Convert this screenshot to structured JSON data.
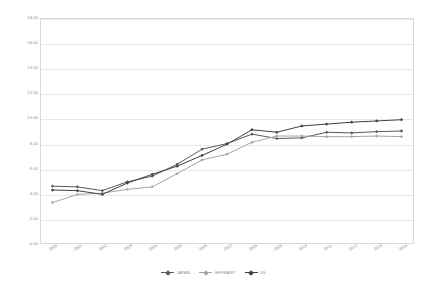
{
  "chart_data": {
    "type": "line",
    "title": "",
    "xlabel": "",
    "ylabel": "",
    "x": [
      "2000",
      "2001",
      "2002",
      "2003",
      "2004",
      "2005",
      "2006",
      "2007",
      "2008",
      "2009",
      "2010",
      "2011",
      "2012",
      "2013",
      "2014"
    ],
    "ylim": [
      0,
      18
    ],
    "ytick_values": [
      "0.00",
      "2.00",
      "4.00",
      "6.00",
      "8.00",
      "10.00",
      "12.00",
      "14.00",
      "16.00",
      "18.00"
    ],
    "grid": true,
    "legend_position": "bottom",
    "series": [
      {
        "name": "JAPAN",
        "color": "#595959",
        "values": [
          4.6,
          4.55,
          4.25,
          4.95,
          5.4,
          6.35,
          7.55,
          8.0,
          8.75,
          8.4,
          8.45,
          8.9,
          8.85,
          8.95,
          9.0
        ]
      },
      {
        "name": "GERMANY",
        "color": "#a6a6a6",
        "values": [
          3.3,
          3.95,
          4.05,
          4.35,
          4.55,
          5.6,
          6.7,
          7.15,
          8.1,
          8.6,
          8.6,
          8.55,
          8.55,
          8.6,
          8.55
        ]
      },
      {
        "name": "US",
        "color": "#404040",
        "values": [
          4.3,
          4.25,
          3.95,
          4.85,
          5.55,
          6.2,
          7.05,
          7.95,
          9.1,
          8.9,
          9.4,
          9.55,
          9.7,
          9.8,
          9.9
        ]
      }
    ]
  },
  "legend": {
    "items": [
      {
        "label": "JAPAN",
        "color": "#595959"
      },
      {
        "label": "GERMANY",
        "color": "#a6a6a6"
      },
      {
        "label": "US",
        "color": "#404040"
      }
    ]
  }
}
